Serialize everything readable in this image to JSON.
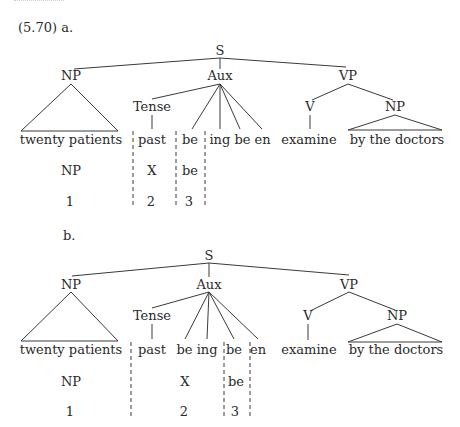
{
  "example_label_a": "(5.70) a.",
  "example_label_b": "b.",
  "tree_a": {
    "root": "S",
    "np": "NP",
    "aux": "Aux",
    "vp": "VP",
    "tense": "Tense",
    "v": "V",
    "np2": "NP",
    "leaves": {
      "subject": "twenty patients",
      "past": "past",
      "be": "be",
      "ing_be_en": "ing be en",
      "verb": "examine",
      "agent": "by the doctors"
    },
    "analysis_row": {
      "col1": "NP",
      "col2": "X",
      "col3": "be"
    },
    "index_row": {
      "col1": "1",
      "col2": "2",
      "col3": "3"
    }
  },
  "tree_b": {
    "root": "S",
    "np": "NP",
    "aux": "Aux",
    "vp": "VP",
    "tense": "Tense",
    "v": "V",
    "np2": "NP",
    "leaves": {
      "subject": "twenty patients",
      "past": "past",
      "be_ing": "be ing",
      "be": "be",
      "en": "en",
      "verb": "examine",
      "agent": "by the doctors"
    },
    "analysis_row": {
      "col1": "NP",
      "col2": "X",
      "col3": "be"
    },
    "index_row": {
      "col1": "1",
      "col2": "2",
      "col3": "3"
    }
  }
}
